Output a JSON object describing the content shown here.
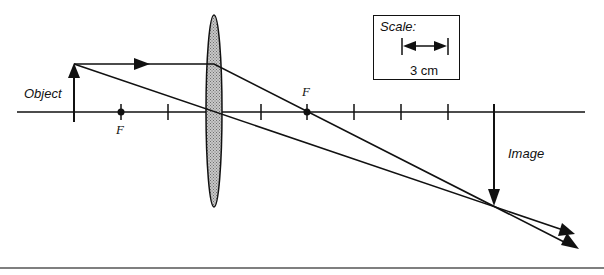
{
  "diagram": {
    "type": "converging-lens ray diagram",
    "labels": {
      "object": "Object",
      "image": "Image",
      "focal_left": "F",
      "focal_right": "F"
    },
    "scale": {
      "title": "Scale:",
      "value": "3 cm"
    },
    "colors": {
      "ink": "#111111",
      "lens_fill": "#b0b0b0",
      "background": "#ffffff"
    }
  }
}
